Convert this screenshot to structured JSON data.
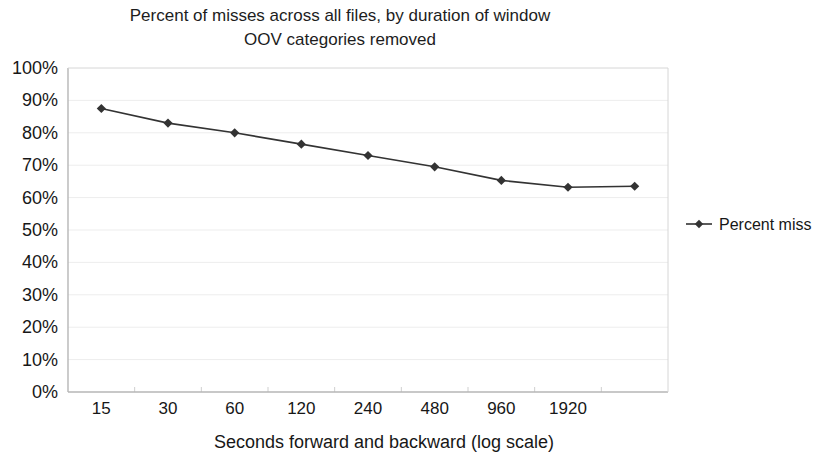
{
  "chart_data": {
    "type": "line",
    "title": "Percent of misses across all files, by duration of window",
    "subtitle": "OOV categories removed",
    "title_lines": [
      "Percent of misses across all files, by duration of window",
      "OOV categories removed"
    ],
    "xlabel": "Seconds forward and backward (log scale)",
    "ylabel": "",
    "categories": [
      "15",
      "30",
      "60",
      "120",
      "240",
      "480",
      "960",
      "1920",
      ""
    ],
    "x_tick_labels": [
      "15",
      "30",
      "60",
      "120",
      "240",
      "480",
      "960",
      "1920"
    ],
    "y_tick_labels": [
      "100%",
      "90%",
      "80%",
      "70%",
      "60%",
      "50%",
      "40%",
      "30%",
      "20%",
      "10%",
      "0%"
    ],
    "y_tick_values": [
      100,
      90,
      80,
      70,
      60,
      50,
      40,
      30,
      20,
      10,
      0
    ],
    "ylim": [
      0,
      100
    ],
    "grid": true,
    "legend_position": "right",
    "series": [
      {
        "name": "Percent miss",
        "marker": "diamond",
        "color": "#333333",
        "values": [
          87.5,
          83.0,
          80.0,
          76.5,
          73.0,
          69.5,
          65.3,
          63.2,
          63.5
        ]
      }
    ]
  },
  "legend": {
    "entries": [
      {
        "label": "Percent miss",
        "color": "#333333",
        "marker": "diamond"
      }
    ]
  },
  "axes": {
    "y_axis_name": "percent-axis",
    "x_axis_name": "window-duration-axis"
  }
}
